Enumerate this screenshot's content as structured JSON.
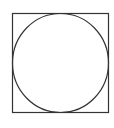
{
  "diagram": {
    "stroke_color": "#333333",
    "background": "#ffffff",
    "square": {
      "x": 12.5,
      "y": 13.5,
      "width": 96,
      "height": 99
    },
    "circle": {
      "cx": 60.5,
      "cy": 63,
      "rx": 48,
      "ry": 49.5
    }
  }
}
